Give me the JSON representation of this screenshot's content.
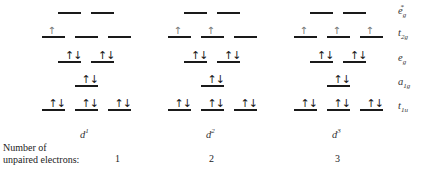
{
  "diagram": {
    "levels": [
      {
        "id": "eg_star",
        "label_main": "e",
        "label_sub": "g",
        "label_sup": "*",
        "degeneracy": 2
      },
      {
        "id": "t2g",
        "label_main": "t",
        "label_sub": "2g",
        "label_sup": "",
        "degeneracy": 3
      },
      {
        "id": "eg",
        "label_main": "e",
        "label_sub": "g",
        "label_sup": "",
        "degeneracy": 2
      },
      {
        "id": "a1g",
        "label_main": "a",
        "label_sub": "1g",
        "label_sup": "",
        "degeneracy": 1
      },
      {
        "id": "t1u",
        "label_main": "t",
        "label_sub": "1u",
        "label_sup": "",
        "degeneracy": 3
      }
    ],
    "configurations": [
      {
        "label_main": "d",
        "label_sup": "1",
        "unpaired": "1",
        "occupancy": {
          "eg_star": [
            0,
            0
          ],
          "t2g": [
            1,
            0,
            0
          ],
          "eg": [
            2,
            2
          ],
          "a1g": [
            2
          ],
          "t1u": [
            2,
            2,
            2
          ]
        }
      },
      {
        "label_main": "d",
        "label_sup": "2",
        "unpaired": "2",
        "occupancy": {
          "eg_star": [
            0,
            0
          ],
          "t2g": [
            1,
            1,
            0
          ],
          "eg": [
            2,
            2
          ],
          "a1g": [
            2
          ],
          "t1u": [
            2,
            2,
            2
          ]
        }
      },
      {
        "label_main": "d",
        "label_sup": "3",
        "unpaired": "3",
        "occupancy": {
          "eg_star": [
            0,
            0
          ],
          "t2g": [
            1,
            1,
            1
          ],
          "eg": [
            2,
            2
          ],
          "a1g": [
            2
          ],
          "t1u": [
            2,
            2,
            2
          ]
        }
      }
    ],
    "caption_line1": "Number of",
    "caption_line2": "unpaired electrons:",
    "spin_up": "↑",
    "spin_pair": "↑↓"
  }
}
